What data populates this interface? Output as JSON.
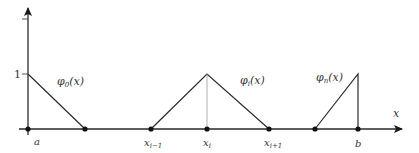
{
  "diagram": {
    "y_axis": {
      "tick_label": "1"
    },
    "x_axis": {
      "label": "x"
    },
    "nodes": [
      {
        "id": "a",
        "label": "a",
        "labeled": true
      },
      {
        "id": "x1",
        "label": "",
        "labeled": false
      },
      {
        "id": "xim1",
        "label": "x",
        "sub": "i−1",
        "labeled": true
      },
      {
        "id": "xi",
        "label": "x",
        "sub": "i",
        "labeled": true
      },
      {
        "id": "xip1",
        "label": "x",
        "sub": "i+1",
        "labeled": true
      },
      {
        "id": "xnm1",
        "label": "",
        "labeled": false
      },
      {
        "id": "b",
        "label": "b",
        "labeled": true
      }
    ],
    "functions": [
      {
        "id": "phi0",
        "name": "φ",
        "sub": "0",
        "arg": "(x)",
        "support": [
          "a",
          "x1"
        ],
        "peak": "a"
      },
      {
        "id": "phii",
        "name": "φ",
        "sub": "i",
        "arg": "(x)",
        "support": [
          "xim1",
          "xip1"
        ],
        "peak": "xi"
      },
      {
        "id": "phin",
        "name": "φ",
        "sub": "n",
        "arg": "(x)",
        "support": [
          "xnm1",
          "b"
        ],
        "peak": "b"
      }
    ],
    "colors": {
      "line": "#2a2a2a",
      "guide": "#9a9a9a",
      "text": "#333333"
    }
  }
}
